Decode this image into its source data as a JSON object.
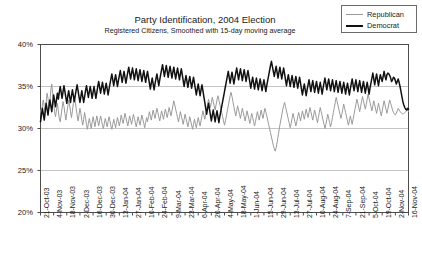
{
  "chart_data": {
    "type": "line",
    "title": "Party Identification, 2004 Election",
    "subtitle": "Registered Citizens, Smoothed with 15-day moving average",
    "xlabel": "",
    "ylabel": "",
    "ylim": [
      20,
      40
    ],
    "ytick_values": [
      20,
      25,
      30,
      35,
      40
    ],
    "ytick_labels": [
      "20%",
      "25%",
      "30%",
      "35%",
      "40%"
    ],
    "grid": true,
    "legend_position": "top-right",
    "legend": [
      "Republican",
      "Democrat"
    ],
    "colors": {
      "republican": "#9a9a9a",
      "democrat": "#111111",
      "grid": "#b5b5b5",
      "axis": "#4d4d4d"
    },
    "x_tick_labels": [
      "21-Oct-03",
      "4-Nov-03",
      "18-Nov-03",
      "2-Dec-03",
      "16-Dec-03",
      "30-Dec-03",
      "13-Jan-04",
      "27-Jan-04",
      "10-Feb-04",
      "24-Feb-04",
      "9-Mar-04",
      "23-Mar-04",
      "6-Apr-04",
      "20-Apr-04",
      "4-May-04",
      "18-May-04",
      "1-Jun-04",
      "15-Jun-04",
      "29-Jun-04",
      "13-Jul-04",
      "27-Jul-04",
      "10-Aug-04",
      "24-Aug-04",
      "7-Sep-04",
      "21-Sep-04",
      "5-Oct-04",
      "19-Oct-04",
      "2-Nov-04",
      "16-Nov-04"
    ],
    "x_range_days": [
      0,
      392
    ],
    "x_tick_interval_days": 14,
    "series": [
      {
        "name": "Republican",
        "color": "#9a9a9a",
        "values": [
          32.2,
          31.5,
          32.8,
          33.4,
          32.6,
          31.8,
          33.1,
          34.2,
          33.6,
          32.4,
          33.0,
          34.6,
          35.3,
          34.1,
          33.2,
          32.0,
          31.4,
          32.2,
          33.0,
          32.1,
          31.2,
          30.8,
          31.6,
          32.4,
          33.2,
          32.6,
          31.8,
          31.0,
          31.8,
          32.6,
          33.4,
          32.8,
          32.0,
          31.3,
          32.1,
          33.0,
          33.8,
          33.2,
          32.4,
          31.6,
          30.9,
          31.6,
          32.4,
          31.8,
          31.0,
          30.4,
          31.1,
          31.9,
          31.2,
          30.5,
          29.9,
          30.6,
          31.2,
          30.6,
          30.0,
          30.7,
          31.4,
          30.8,
          30.2,
          30.9,
          31.5,
          30.9,
          30.3,
          30.9,
          31.5,
          31.0,
          30.4,
          30.0,
          30.6,
          31.2,
          30.7,
          30.2,
          30.8,
          31.4,
          30.9,
          30.3,
          29.9,
          30.5,
          31.1,
          30.6,
          30.1,
          30.7,
          31.3,
          30.8,
          30.3,
          30.9,
          31.6,
          31.1,
          30.6,
          31.2,
          31.8,
          31.3,
          30.8,
          30.3,
          30.9,
          31.5,
          31.0,
          30.5,
          31.1,
          31.7,
          31.2,
          30.7,
          30.2,
          30.8,
          31.4,
          30.9,
          30.4,
          31.0,
          31.6,
          31.1,
          30.6,
          30.1,
          30.7,
          31.3,
          30.8,
          31.4,
          32.0,
          31.5,
          31.0,
          31.6,
          32.2,
          31.7,
          31.2,
          31.8,
          32.4,
          31.9,
          31.4,
          30.9,
          31.5,
          32.1,
          31.6,
          31.1,
          31.7,
          32.3,
          31.8,
          31.3,
          31.9,
          32.5,
          32.0,
          31.5,
          32.1,
          32.7,
          33.3,
          32.8,
          32.3,
          31.8,
          31.3,
          30.8,
          31.4,
          32.0,
          31.5,
          31.0,
          30.5,
          31.1,
          31.7,
          31.2,
          30.7,
          30.2,
          30.8,
          31.4,
          30.9,
          30.4,
          29.9,
          30.5,
          31.1,
          30.6,
          30.1,
          30.7,
          31.3,
          30.8,
          30.3,
          30.9,
          31.5,
          32.1,
          31.6,
          31.1,
          31.7,
          32.3,
          32.9,
          33.5,
          33.0,
          32.5,
          33.1,
          33.7,
          33.2,
          32.7,
          32.2,
          32.8,
          33.4,
          33.9,
          33.4,
          32.9,
          32.4,
          31.9,
          31.4,
          30.9,
          30.4,
          30.9,
          31.5,
          32.1,
          32.7,
          33.3,
          33.9,
          34.3,
          33.8,
          33.2,
          32.6,
          32.0,
          31.5,
          32.1,
          32.7,
          32.2,
          31.7,
          31.2,
          31.8,
          32.4,
          31.9,
          31.4,
          30.9,
          31.5,
          32.1,
          31.6,
          31.1,
          30.6,
          31.2,
          31.8,
          31.3,
          30.8,
          30.3,
          30.8,
          31.4,
          32.0,
          31.5,
          31.0,
          31.6,
          32.2,
          31.7,
          31.2,
          31.8,
          32.4,
          32.0,
          31.5,
          31.0,
          30.5,
          30.0,
          29.5,
          29.0,
          28.5,
          28.0,
          27.6,
          27.3,
          27.7,
          28.3,
          29.0,
          29.7,
          30.4,
          31.0,
          31.6,
          32.2,
          32.7,
          33.1,
          32.6,
          32.1,
          31.6,
          31.1,
          30.6,
          30.1,
          30.6,
          31.2,
          31.8,
          31.3,
          30.8,
          30.3,
          30.8,
          31.4,
          31.9,
          31.4,
          30.9,
          31.5,
          32.1,
          31.6,
          31.1,
          31.7,
          32.3,
          31.8,
          31.3,
          31.9,
          32.5,
          32.0,
          31.5,
          31.0,
          31.6,
          32.2,
          31.7,
          31.2,
          30.7,
          31.3,
          31.9,
          32.5,
          32.0,
          31.5,
          31.0,
          30.5,
          30.0,
          30.5,
          31.1,
          31.7,
          31.2,
          30.7,
          30.2,
          30.7,
          31.3,
          31.9,
          32.5,
          33.1,
          33.7,
          33.2,
          32.7,
          32.2,
          31.7,
          31.2,
          31.7,
          32.3,
          32.9,
          32.4,
          31.9,
          31.4,
          30.9,
          30.4,
          30.9,
          31.5,
          31.0,
          30.5,
          31.1,
          31.7,
          32.3,
          32.9,
          33.5,
          33.0,
          32.5,
          32.0,
          32.6,
          33.2,
          33.8,
          33.3,
          32.8,
          32.3,
          32.9,
          33.5,
          34.1,
          33.6,
          33.1,
          32.6,
          32.1,
          32.7,
          33.3,
          32.8,
          32.3,
          31.8,
          32.4,
          33.0,
          32.5,
          32.0,
          31.5,
          32.1,
          32.7,
          33.3,
          32.8,
          32.3,
          31.8,
          32.3,
          32.9,
          33.4,
          33.0,
          32.6,
          32.2,
          31.9,
          31.7,
          31.6,
          31.8,
          32.1,
          32.4,
          32.2,
          32.0,
          31.9,
          31.8,
          31.7,
          31.8,
          31.9,
          32.0,
          32.1,
          32.2,
          32.0
        ]
      },
      {
        "name": "Democrat",
        "color": "#111111",
        "values": [
          30.8,
          31.6,
          32.4,
          31.7,
          31.0,
          32.0,
          33.0,
          32.3,
          31.6,
          32.6,
          33.4,
          32.7,
          32.0,
          33.0,
          34.0,
          33.3,
          32.6,
          33.4,
          34.2,
          33.5,
          34.3,
          35.0,
          34.3,
          33.6,
          34.4,
          35.1,
          34.4,
          33.7,
          33.0,
          33.8,
          34.5,
          33.8,
          33.1,
          33.9,
          34.6,
          33.9,
          33.2,
          33.9,
          34.6,
          35.2,
          34.5,
          33.8,
          33.1,
          33.8,
          34.5,
          33.8,
          33.1,
          33.8,
          34.5,
          35.1,
          34.4,
          33.7,
          34.4,
          35.0,
          34.3,
          33.6,
          34.3,
          35.0,
          34.3,
          33.6,
          34.3,
          35.0,
          35.6,
          34.9,
          34.2,
          34.9,
          35.5,
          34.8,
          34.1,
          34.8,
          35.4,
          34.7,
          34.0,
          34.7,
          35.3,
          35.9,
          36.5,
          35.8,
          35.1,
          35.8,
          36.4,
          35.7,
          35.0,
          35.7,
          36.3,
          36.9,
          36.2,
          35.5,
          36.2,
          36.8,
          36.1,
          35.4,
          36.1,
          36.7,
          37.3,
          36.6,
          35.9,
          36.6,
          37.2,
          36.5,
          35.8,
          36.5,
          37.1,
          36.4,
          35.7,
          36.4,
          37.0,
          36.3,
          35.6,
          36.3,
          36.9,
          36.2,
          35.5,
          36.2,
          36.8,
          36.1,
          35.4,
          34.7,
          35.4,
          36.0,
          35.3,
          34.6,
          35.3,
          35.9,
          36.5,
          35.8,
          35.1,
          35.8,
          36.4,
          37.0,
          37.6,
          36.9,
          36.2,
          36.9,
          37.5,
          36.8,
          36.1,
          36.8,
          37.4,
          36.7,
          36.0,
          36.7,
          37.3,
          36.6,
          35.9,
          36.6,
          37.2,
          36.5,
          35.8,
          36.5,
          37.1,
          36.4,
          35.7,
          35.0,
          35.7,
          36.3,
          35.6,
          34.9,
          35.6,
          36.2,
          35.5,
          34.8,
          35.5,
          36.1,
          35.4,
          34.7,
          34.0,
          34.7,
          35.3,
          34.6,
          33.9,
          34.6,
          35.2,
          34.5,
          33.8,
          33.1,
          32.4,
          31.7,
          32.4,
          33.0,
          32.3,
          31.6,
          30.9,
          31.6,
          32.2,
          31.5,
          30.8,
          31.5,
          32.1,
          31.4,
          30.7,
          31.4,
          32.0,
          32.6,
          33.2,
          33.8,
          34.4,
          35.0,
          35.6,
          36.2,
          36.8,
          36.1,
          35.4,
          36.1,
          36.7,
          36.0,
          35.3,
          36.0,
          36.6,
          37.2,
          36.5,
          35.8,
          36.5,
          37.1,
          36.4,
          35.7,
          36.4,
          37.0,
          36.3,
          35.6,
          36.3,
          36.9,
          36.2,
          35.5,
          34.8,
          35.5,
          36.1,
          35.4,
          34.7,
          35.4,
          36.0,
          35.3,
          34.6,
          35.3,
          35.9,
          35.2,
          34.5,
          35.2,
          35.8,
          35.1,
          34.4,
          35.1,
          35.7,
          36.3,
          36.9,
          37.5,
          38.0,
          37.4,
          36.8,
          36.2,
          36.8,
          37.4,
          36.7,
          36.0,
          36.7,
          37.3,
          36.6,
          35.9,
          36.6,
          37.2,
          36.5,
          35.8,
          35.1,
          35.8,
          36.4,
          35.7,
          35.0,
          35.7,
          36.3,
          35.6,
          34.9,
          35.6,
          36.2,
          35.5,
          34.8,
          35.5,
          36.1,
          35.4,
          34.7,
          34.0,
          34.7,
          35.3,
          34.6,
          33.9,
          34.6,
          35.2,
          35.8,
          35.1,
          34.4,
          35.1,
          35.7,
          35.0,
          34.3,
          35.0,
          35.6,
          34.9,
          34.2,
          34.9,
          35.5,
          34.8,
          34.1,
          34.8,
          35.4,
          36.0,
          35.3,
          34.6,
          35.3,
          35.9,
          35.2,
          34.5,
          35.2,
          35.8,
          35.1,
          34.4,
          35.1,
          35.7,
          35.0,
          34.3,
          35.0,
          35.6,
          34.9,
          34.2,
          34.9,
          35.5,
          34.8,
          34.1,
          34.8,
          35.4,
          34.7,
          34.0,
          34.7,
          35.3,
          35.9,
          35.2,
          34.5,
          35.2,
          35.8,
          35.1,
          34.4,
          35.1,
          35.7,
          35.0,
          34.3,
          35.0,
          35.6,
          34.9,
          34.2,
          34.9,
          35.5,
          34.8,
          34.1,
          34.8,
          35.4,
          36.0,
          36.6,
          35.9,
          35.2,
          35.9,
          36.5,
          35.8,
          35.1,
          35.8,
          36.4,
          36.0,
          35.6,
          36.2,
          36.8,
          36.2,
          35.8,
          36.4,
          36.6,
          36.5,
          36.3,
          36.0,
          35.6,
          35.8,
          36.1,
          36.0,
          35.7,
          35.3,
          35.6,
          35.9,
          35.5,
          35.0,
          34.4,
          33.8,
          33.2,
          32.8,
          32.5,
          32.3,
          32.2,
          32.4,
          32.3
        ]
      }
    ]
  }
}
